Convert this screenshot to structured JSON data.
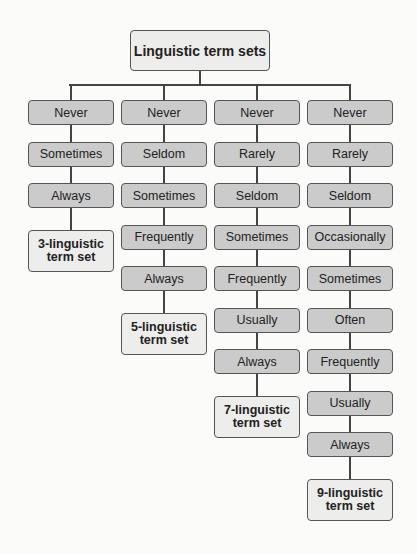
{
  "diagram": {
    "title": "Linguistic term sets",
    "columns": [
      {
        "terms": [
          "Never",
          "Sometimes",
          "Always"
        ],
        "result": "3-linguistic term set"
      },
      {
        "terms": [
          "Never",
          "Seldom",
          "Sometimes",
          "Frequently",
          "Always"
        ],
        "result": "5-linguistic term set"
      },
      {
        "terms": [
          "Never",
          "Rarely",
          "Seldom",
          "Sometimes",
          "Frequently",
          "Usually",
          "Always"
        ],
        "result": "7-linguistic term set"
      },
      {
        "terms": [
          "Never",
          "Rarely",
          "Seldom",
          "Occasionally",
          "Sometimes",
          "Often",
          "Frequently",
          "Usually",
          "Always"
        ],
        "result": "9-linguistic term set"
      }
    ],
    "colors": {
      "term_fill": "#cbcbcb",
      "leaf_fill": "#ededeb",
      "border": "#555555"
    }
  }
}
